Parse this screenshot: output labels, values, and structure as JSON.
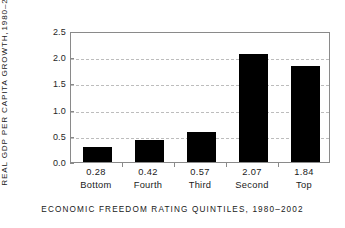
{
  "chart_data": {
    "type": "bar",
    "title": "",
    "xlabel": "ECONOMIC FREEDOM RATING QUINTILES, 1980–2002",
    "ylabel_line1": "REAL GDP PER CAPITA GROWTH,",
    "ylabel_line2": "1980–2002",
    "categories": [
      "Bottom",
      "Fourth",
      "Third",
      "Second",
      "Top"
    ],
    "values": [
      0.28,
      0.42,
      0.57,
      2.07,
      1.84
    ],
    "value_labels": [
      "0.28",
      "0.42",
      "0.57",
      "2.07",
      "1.84"
    ],
    "ylim": [
      0.0,
      2.5
    ],
    "yticks": [
      0.0,
      0.5,
      1.0,
      1.5,
      2.0,
      2.5
    ],
    "ytick_labels": [
      "0.0",
      "0.5",
      "1.0",
      "1.5",
      "2.0",
      "2.5"
    ],
    "gridlines_at": [
      0.5,
      1.0,
      1.5,
      2.0
    ],
    "grid": true,
    "legend": false,
    "bar_color": "#000000",
    "grid_color": "#bdbdbd",
    "axis_color": "#8a8a8a",
    "background_color": "#ffffff"
  }
}
